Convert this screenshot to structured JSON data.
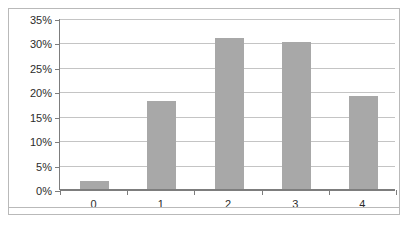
{
  "chart_data": {
    "type": "bar",
    "title": "",
    "subtitle": "",
    "xlabel": "",
    "ylabel": "",
    "categories": [
      "0",
      "1",
      "2",
      "3",
      "4"
    ],
    "values": [
      1.7,
      18,
      31,
      30,
      19
    ],
    "value_labels": [
      "",
      "",
      "",
      "",
      ""
    ],
    "ylim": [
      0,
      35
    ],
    "ytick_values": [
      0,
      5,
      10,
      15,
      20,
      25,
      30,
      35
    ],
    "ytick_labels": [
      "0%",
      "5%",
      "10%",
      "15%",
      "20%",
      "25%",
      "30%",
      "35%"
    ],
    "y_axis_format": "percent",
    "grid": true,
    "grid_axis": "y",
    "legend": false,
    "legend_position": "none",
    "annotations": [],
    "series": [
      {
        "name": "Series 1",
        "values": [
          1.7,
          18,
          31,
          30,
          19
        ]
      }
    ]
  },
  "style": {
    "bar_color": "#a8a8a8",
    "gridline_color": "#c4c4c4",
    "axis_color": "#7d7d7d",
    "frame_color": "#b9b9b9",
    "text_color": "#2b2b2b",
    "background": "#ffffff"
  }
}
